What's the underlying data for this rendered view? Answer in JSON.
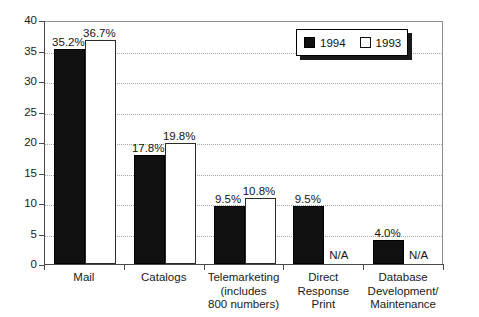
{
  "chart_data": {
    "type": "bar",
    "title": "",
    "xlabel": "",
    "ylabel": "",
    "ylim": [
      0,
      40
    ],
    "ytick_labels": [
      "0",
      "5",
      "10",
      "15",
      "20",
      "25",
      "30",
      "35",
      "40"
    ],
    "ytick_values": [
      0,
      5,
      10,
      15,
      20,
      25,
      30,
      35,
      40
    ],
    "grid": true,
    "grid_axis": "y",
    "grid_style": "dotted",
    "legend_position": "top-right",
    "categories": [
      "Mail",
      "Catalogs",
      "Telemarketing\n(includes\n800 numbers)",
      "Direct\nResponse\nPrint",
      "Database\nDevelopment/\nMaintenance"
    ],
    "series": [
      {
        "name": "1994",
        "color": "#111111",
        "values": [
          35.2,
          17.8,
          9.5,
          9.5,
          4.0
        ],
        "labels": [
          "35.2%",
          "17.8%",
          "9.5%",
          "9.5%",
          "4.0%"
        ]
      },
      {
        "name": "1993",
        "color": "#ffffff",
        "values": [
          36.7,
          19.8,
          10.8,
          null,
          null
        ],
        "labels": [
          "36.7%",
          "19.8%",
          "10.8%",
          "N/A",
          "N/A"
        ]
      }
    ]
  },
  "legend": {
    "entries": [
      {
        "label": "1994",
        "swatch": "black"
      },
      {
        "label": "1993",
        "swatch": "white"
      }
    ]
  },
  "axis": {
    "y_labels": [
      "40",
      "35",
      "30",
      "25",
      "20",
      "15",
      "10",
      "5",
      "0"
    ]
  },
  "labels": {
    "cat_0": "Mail",
    "cat_1": "Catalogs",
    "cat_2": "Telemarketing\n(includes\n800 numbers)",
    "cat_3": "Direct\nResponse\nPrint",
    "cat_4": "Database\nDevelopment/\nMaintenance",
    "v_1994_0": "35.2%",
    "v_1993_0": "36.7%",
    "v_1994_1": "17.8%",
    "v_1993_1": "19.8%",
    "v_1994_2": "9.5%",
    "v_1993_2": "10.8%",
    "v_1994_3": "9.5%",
    "v_1993_3": "N/A",
    "v_1994_4": "4.0%",
    "v_1993_4": "N/A"
  },
  "title_sliver": ""
}
